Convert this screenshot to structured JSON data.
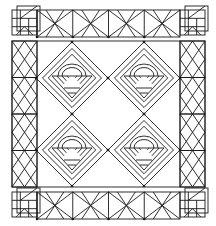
{
  "colors": {
    "line": "#1a1a1a",
    "background": "#ffffff"
  },
  "layout": {
    "top_strip": {
      "x": 37,
      "y": 10,
      "w": 143,
      "h": 27,
      "segments": 4
    },
    "bottom_strip": {
      "x": 37,
      "y": 192,
      "w": 143,
      "h": 27,
      "segments": 4
    },
    "corner_blocks": [
      {
        "pos": "top-left",
        "x": 12,
        "y": 10,
        "size": 25
      },
      {
        "pos": "top-right",
        "x": 180,
        "y": 10,
        "size": 25
      },
      {
        "pos": "bottom-left",
        "x": 12,
        "y": 192,
        "size": 25
      },
      {
        "pos": "bottom-right",
        "x": 180,
        "y": 192,
        "size": 25
      }
    ],
    "panel": {
      "x": 12,
      "y": 41,
      "w": 193,
      "h": 146
    },
    "side_columns": [
      {
        "x": 12,
        "y": 41,
        "w": 25,
        "h": 146,
        "segments": 4
      },
      {
        "x": 180,
        "y": 41,
        "w": 25,
        "h": 146,
        "segments": 4
      }
    ],
    "baskets": [
      {
        "cx": 72,
        "cy": 78,
        "r": 36
      },
      {
        "cx": 144,
        "cy": 78,
        "r": 36
      },
      {
        "cx": 72,
        "cy": 150,
        "r": 36
      },
      {
        "cx": 144,
        "cy": 150,
        "r": 36
      }
    ]
  }
}
